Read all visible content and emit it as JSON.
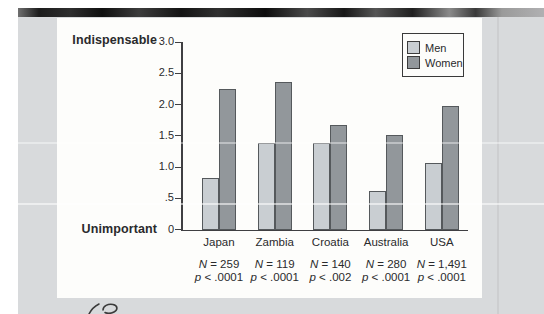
{
  "figure": {
    "y_axis": {
      "top_label": "Indispensable",
      "bottom_label": "Unimportant"
    },
    "colors": {
      "page_background": "#d8dadc",
      "panel_background": "#fdfdfb",
      "axis": "#3f3f42",
      "text": "#2a2a2c",
      "men_bar": "#c9ced2",
      "women_bar": "#92979b",
      "bar_border": "#55595c",
      "scan_edge": "#1a1a1a"
    }
  },
  "chart_data": {
    "type": "bar",
    "categories": [
      "Japan",
      "Zambia",
      "Croatia",
      "Australia",
      "USA"
    ],
    "series": [
      {
        "name": "Men",
        "color": "#c9ced2",
        "values": [
          0.83,
          1.39,
          1.39,
          0.61,
          1.07
        ]
      },
      {
        "name": "Women",
        "color": "#92979b",
        "values": [
          2.25,
          2.36,
          1.67,
          1.52,
          1.97
        ]
      }
    ],
    "annotations": [
      {
        "n": "N = 259",
        "p": "p < .0001"
      },
      {
        "n": "N = 119",
        "p": "p < .0001"
      },
      {
        "n": "N = 140",
        "p": "p < .002"
      },
      {
        "n": "N = 280",
        "p": "p < .0001"
      },
      {
        "n": "N = 1,491",
        "p": "p < .0001"
      }
    ],
    "yticks": [
      {
        "label": "3.0",
        "value": 3.0
      },
      {
        "label": "2.5",
        "value": 2.5
      },
      {
        "label": "2.0",
        "value": 2.0
      },
      {
        "label": "1.5",
        "value": 1.5
      },
      {
        "label": "1.0",
        "value": 1.0
      },
      {
        "label": ".5",
        "value": 0.5
      },
      {
        "label": "0",
        "value": 0.0
      }
    ],
    "ylim": [
      0,
      3.0
    ],
    "ylabel_top": "Indispensable",
    "ylabel_bottom": "Unimportant",
    "legend": {
      "position": "top-right",
      "entries": [
        "Men",
        "Women"
      ]
    },
    "grid": false,
    "title": ""
  }
}
